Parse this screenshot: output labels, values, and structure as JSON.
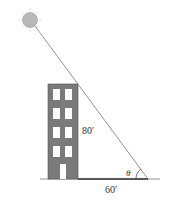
{
  "diagram": {
    "labels": {
      "height": "80′",
      "shadow": "60′",
      "angle": "θ"
    },
    "colors": {
      "building": "#7a7a7a",
      "window": "#ffffff",
      "sun": "#b8b8b8",
      "ray": "#666666",
      "ground": "#555555"
    },
    "building": {
      "floors": 4,
      "windows_per_floor": 2,
      "door": true
    }
  }
}
